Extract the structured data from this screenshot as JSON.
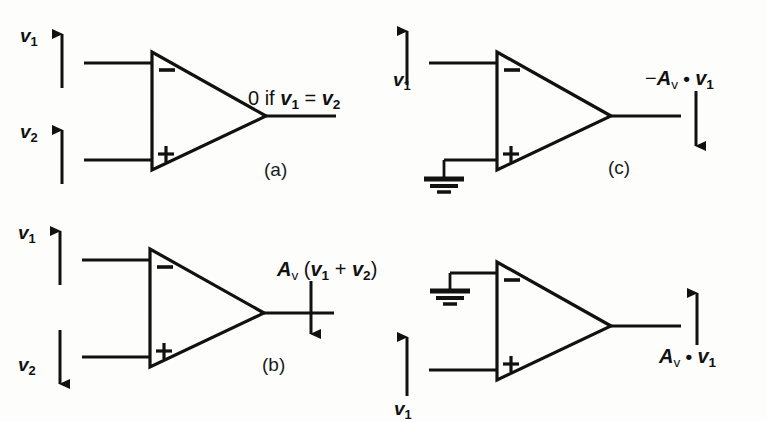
{
  "figure": {
    "kind": "op-amp-schematic-figure",
    "background_color": "#fdfdfc",
    "line_color": "#111111",
    "panel_count": 4
  },
  "panels": {
    "a": {
      "tag": "(a)",
      "input_top_label": "v",
      "input_top_sub": "1",
      "input_top_arrow": "up",
      "input_bottom_label": "v",
      "input_bottom_sub": "2",
      "input_bottom_arrow": "up",
      "minus_sign": "−",
      "plus_sign": "+",
      "output_expr_prefix": "0 if ",
      "output_var1": "v",
      "output_var1_sub": "1",
      "output_equals": " = ",
      "output_var2": "v",
      "output_var2_sub": "2",
      "output_arrow": "none",
      "ground": "none"
    },
    "b": {
      "tag": "(b)",
      "input_top_label": "v",
      "input_top_sub": "1",
      "input_top_arrow": "up",
      "input_bottom_label": "v",
      "input_bottom_sub": "2",
      "input_bottom_arrow": "down",
      "minus_sign": "−",
      "plus_sign": "+",
      "output_gain": "A",
      "output_gain_sub": "v",
      "output_open": " (",
      "output_var1": "v",
      "output_var1_sub": "1",
      "output_plus": " + ",
      "output_var2": "v",
      "output_var2_sub": "2",
      "output_close": ")",
      "output_arrow": "down",
      "ground": "none"
    },
    "c": {
      "tag": "(c)",
      "input_top_label": "v",
      "input_top_sub": "1",
      "input_top_arrow": "up",
      "minus_sign": "−",
      "plus_sign": "+",
      "output_sign": "−",
      "output_gain": "A",
      "output_gain_sub": "v",
      "output_dot": " • ",
      "output_var1": "v",
      "output_var1_sub": "1",
      "output_arrow": "down",
      "ground": "inverting-input-grounded",
      "ground_position": "bottom-left"
    },
    "d": {
      "tag": "",
      "input_bottom_label": "v",
      "input_bottom_sub": "1",
      "input_bottom_arrow": "up",
      "minus_sign": "−",
      "plus_sign": "+",
      "output_gain": "A",
      "output_gain_sub": "v",
      "output_dot": " • ",
      "output_var1": "v",
      "output_var1_sub": "1",
      "output_arrow": "up",
      "ground": "non-inverting-input-grounded",
      "ground_position": "top-left"
    }
  }
}
